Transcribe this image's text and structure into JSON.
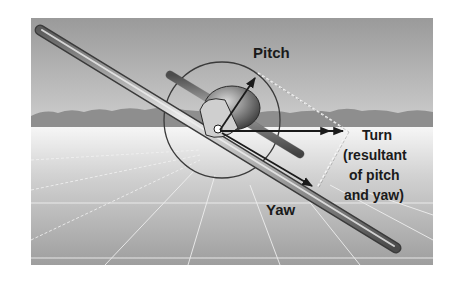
{
  "figure": {
    "labels": {
      "pitch": "Pitch",
      "turn_line1": "Turn",
      "turn_line2": "(resultant",
      "turn_line3": "of pitch",
      "turn_line4": "and yaw)",
      "yaw": "Yaw"
    },
    "vectors": [
      {
        "name": "pitch",
        "label": "Pitch"
      },
      {
        "name": "yaw",
        "label": "Yaw"
      },
      {
        "name": "turn",
        "label": "Turn (resultant of pitch and yaw)"
      }
    ],
    "colors": {
      "sky_top": "#9a9a9a",
      "sky_bottom": "#c8c8c8",
      "mountains": "#8c8c8c",
      "ground_top": "#f4f4f4",
      "ground_bottom": "#9c9c9c",
      "line": "#222222"
    }
  }
}
